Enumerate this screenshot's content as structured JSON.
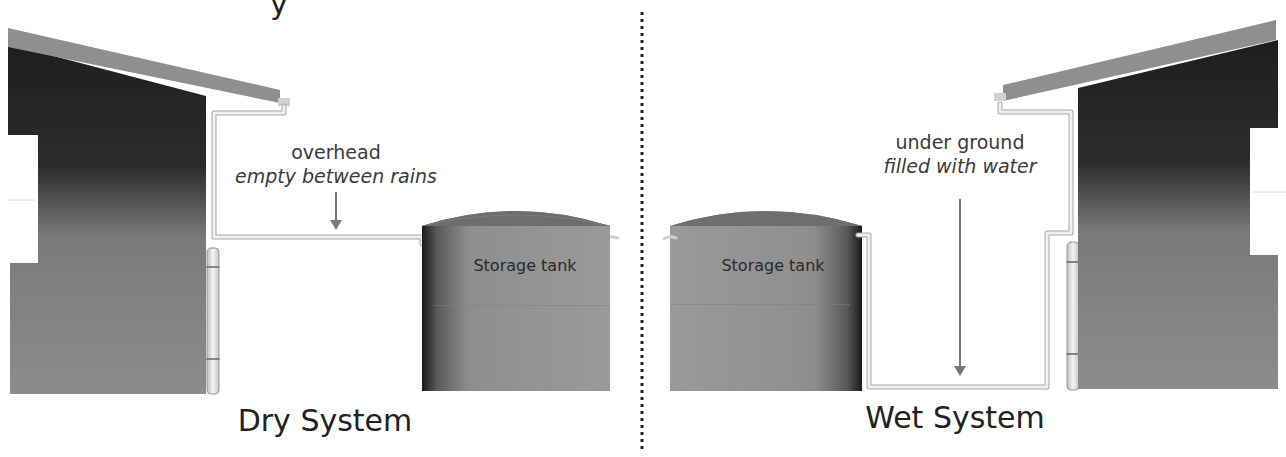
{
  "diagram": {
    "title_partial_left": "y",
    "divider": {
      "style": "dotted",
      "color": "#222222"
    },
    "colors": {
      "roof": "#8f8f8f",
      "wall_top": "#262626",
      "wall": "#8a8a8a",
      "tank_body": "#8d8d8d",
      "tank_lid": "#6e6e6e",
      "pipe": "#e8e8e8",
      "arrow": "#777777"
    },
    "left_panel": {
      "system_title": "Dry System",
      "annotation_line1": "overhead",
      "annotation_line2": "empty between rains",
      "tank_label": "Storage tank",
      "pipe_route": "overhead"
    },
    "right_panel": {
      "system_title": "Wet System",
      "annotation_line1": "under ground",
      "annotation_line2": "filled with water",
      "tank_label": "Storage tank",
      "pipe_route": "under ground"
    }
  }
}
